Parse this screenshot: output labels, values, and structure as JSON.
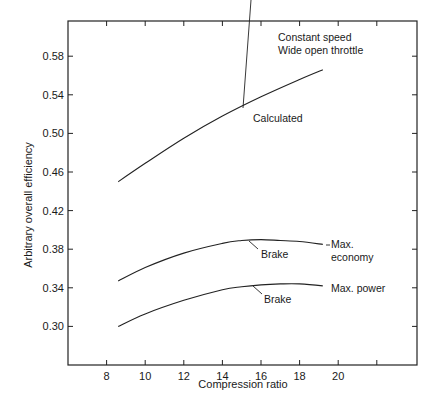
{
  "chart_data": {
    "type": "line",
    "title": "",
    "xlabel": "Compression ratio",
    "ylabel": "Arbitrary overall efficiency",
    "xlim": [
      6,
      24
    ],
    "ylim": [
      0.26,
      0.614
    ],
    "x_ticks": [
      8,
      10,
      12,
      14,
      16,
      18,
      20
    ],
    "x_tick_labels": [
      "8",
      "10",
      "12",
      "14",
      "16",
      "18",
      "20"
    ],
    "y_ticks": [
      0.3,
      0.34,
      0.38,
      0.42,
      0.46,
      0.5,
      0.54,
      0.58
    ],
    "y_tick_labels": [
      "0.30",
      "0.34",
      "0.38",
      "0.42",
      "0.46",
      "0.50",
      "0.54",
      "0.58"
    ],
    "grid": false,
    "legend": "none (curves labeled inline)",
    "annotations": {
      "conditions_line1": "Constant speed",
      "conditions_line2": "Wide open throttle",
      "calculated": "Calculated",
      "brake_economy": "Brake",
      "max_economy_line1": "Max.",
      "max_economy_line2": "economy",
      "brake_power": "Brake",
      "max_power": "Max. power"
    },
    "series": [
      {
        "name": "Calculated",
        "x": [
          8.6,
          10,
          12,
          14,
          16,
          18,
          19.2
        ],
        "values": [
          0.45,
          0.469,
          0.495,
          0.518,
          0.538,
          0.556,
          0.566
        ]
      },
      {
        "name": "Brake (Max. economy)",
        "x": [
          8.6,
          10,
          12,
          14,
          15,
          16,
          17,
          18,
          19.2
        ],
        "values": [
          0.347,
          0.361,
          0.376,
          0.386,
          0.389,
          0.39,
          0.389,
          0.388,
          0.385
        ]
      },
      {
        "name": "Brake (Max. power)",
        "x": [
          8.6,
          10,
          12,
          14,
          15,
          16,
          17,
          18,
          19.2
        ],
        "values": [
          0.3,
          0.313,
          0.327,
          0.338,
          0.341,
          0.343,
          0.344,
          0.344,
          0.342
        ]
      }
    ]
  }
}
